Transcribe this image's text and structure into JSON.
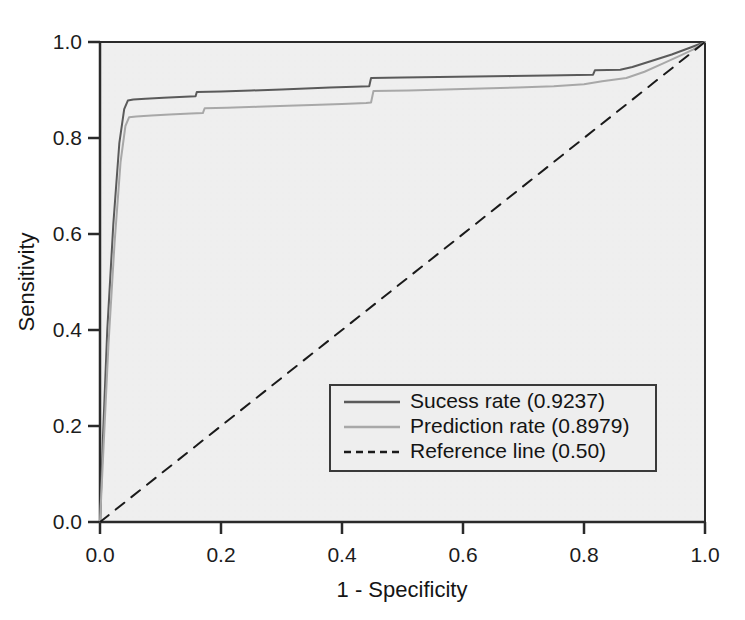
{
  "chart_data": {
    "type": "line",
    "title": "",
    "subtitle": "",
    "xlabel": "1 - Specificity",
    "ylabel": "Sensitivity",
    "xlim": [
      0.0,
      1.0
    ],
    "ylim": [
      0.0,
      1.0
    ],
    "xticks": [
      "0.0",
      "0.2",
      "0.4",
      "0.6",
      "0.8",
      "1.0"
    ],
    "xtick_values": [
      0.0,
      0.2,
      0.4,
      0.6,
      0.8,
      1.0
    ],
    "yticks": [
      "0.0",
      "0.2",
      "0.4",
      "0.6",
      "0.8",
      "1.0"
    ],
    "ytick_values": [
      0.0,
      0.2,
      0.4,
      0.6,
      0.8,
      1.0
    ],
    "grid": false,
    "legend_position": "lower right",
    "plot_background": "#f0f0f0",
    "figure_background": "#ffffff",
    "series": [
      {
        "name": "Sucess rate (0.9237)",
        "short_name": "Sucess rate",
        "auc": 0.9237,
        "color": "#5a5a5a",
        "linestyle": "solid",
        "linewidth": 2,
        "x": [
          0.0,
          0.005,
          0.012,
          0.022,
          0.032,
          0.04,
          0.046,
          0.055,
          0.075,
          0.105,
          0.14,
          0.158,
          0.16,
          0.2,
          0.25,
          0.3,
          0.34,
          0.38,
          0.42,
          0.445,
          0.448,
          0.5,
          0.56,
          0.62,
          0.68,
          0.74,
          0.79,
          0.815,
          0.818,
          0.86,
          0.88,
          0.91,
          0.945,
          0.975,
          1.0
        ],
        "y": [
          0.0,
          0.18,
          0.4,
          0.62,
          0.79,
          0.86,
          0.878,
          0.88,
          0.882,
          0.884,
          0.886,
          0.887,
          0.896,
          0.897,
          0.899,
          0.901,
          0.903,
          0.905,
          0.907,
          0.908,
          0.925,
          0.926,
          0.927,
          0.928,
          0.929,
          0.93,
          0.931,
          0.932,
          0.941,
          0.942,
          0.948,
          0.96,
          0.974,
          0.988,
          1.0
        ]
      },
      {
        "name": "Prediction rate (0.8979)",
        "short_name": "Prediction rate",
        "auc": 0.8979,
        "color": "#a8a8a8",
        "linestyle": "solid",
        "linewidth": 2,
        "x": [
          0.0,
          0.006,
          0.014,
          0.024,
          0.034,
          0.042,
          0.048,
          0.06,
          0.085,
          0.115,
          0.15,
          0.17,
          0.173,
          0.21,
          0.26,
          0.31,
          0.35,
          0.4,
          0.44,
          0.448,
          0.452,
          0.51,
          0.57,
          0.63,
          0.69,
          0.75,
          0.8,
          0.83,
          0.87,
          0.9,
          0.93,
          0.96,
          0.98,
          1.0
        ],
        "y": [
          0.0,
          0.16,
          0.37,
          0.58,
          0.75,
          0.825,
          0.843,
          0.845,
          0.847,
          0.849,
          0.851,
          0.852,
          0.862,
          0.863,
          0.865,
          0.867,
          0.869,
          0.871,
          0.873,
          0.874,
          0.898,
          0.899,
          0.901,
          0.903,
          0.905,
          0.908,
          0.912,
          0.918,
          0.925,
          0.938,
          0.955,
          0.972,
          0.984,
          1.0
        ]
      },
      {
        "name": "Reference line (0.50)",
        "short_name": "Reference line",
        "auc": 0.5,
        "color": "#1a1a1a",
        "linestyle": "dashed",
        "linewidth": 2,
        "x": [
          0.0,
          1.0
        ],
        "y": [
          0.0,
          1.0
        ]
      }
    ],
    "legend_entries": [
      {
        "label": "Sucess rate (0.9237)",
        "color": "#5a5a5a",
        "linestyle": "solid"
      },
      {
        "label": "Prediction rate (0.8979)",
        "color": "#a8a8a8",
        "linestyle": "solid"
      },
      {
        "label": "Reference line (0.50)",
        "color": "#1a1a1a",
        "linestyle": "dashed"
      }
    ]
  }
}
